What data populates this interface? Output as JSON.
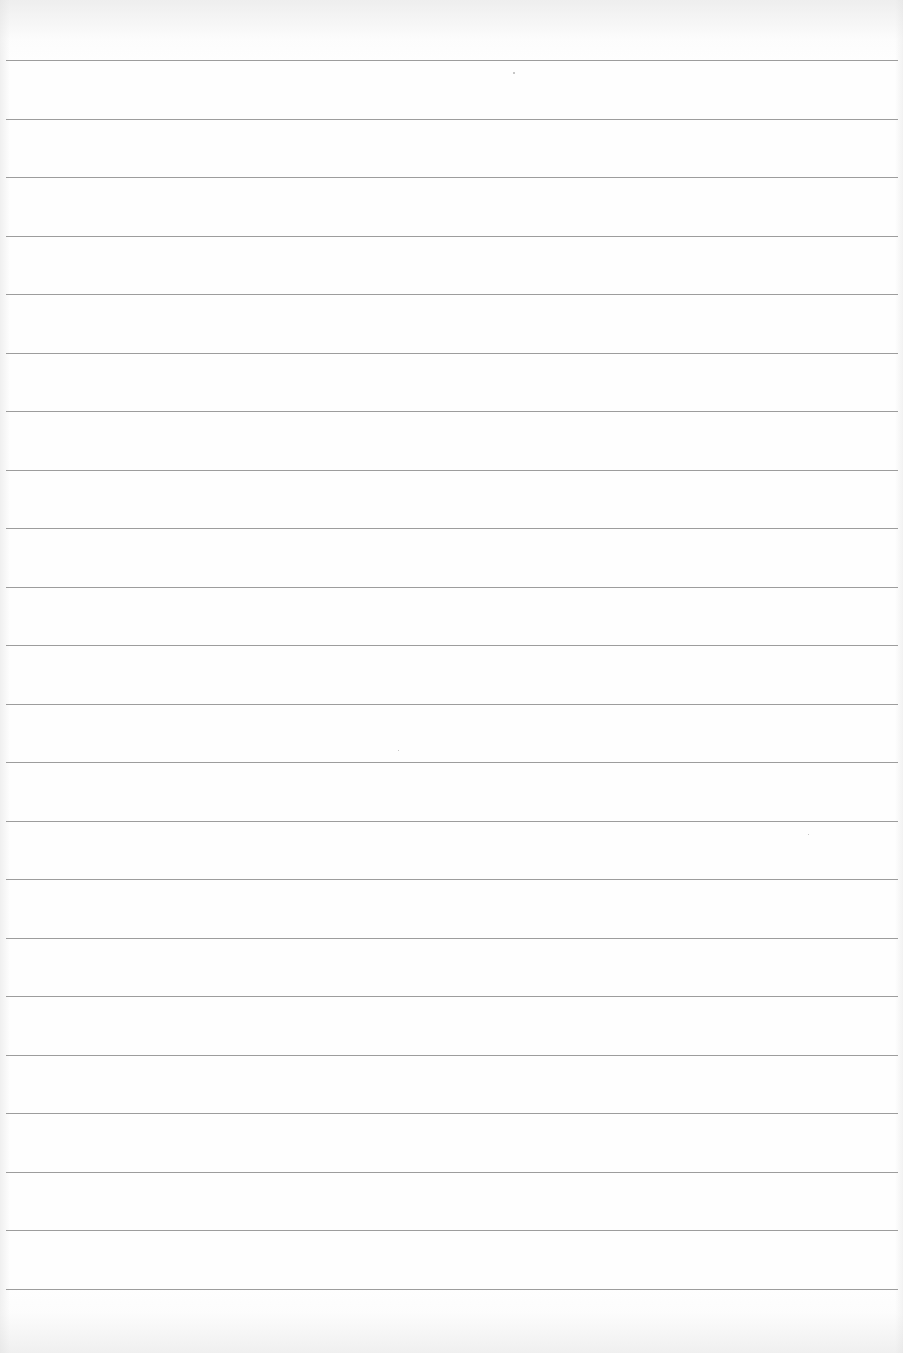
{
  "page": {
    "type": "blank lined paper",
    "background_color": "#fdfdfd",
    "rule_color": "#8c8c8c",
    "rule_count": 22,
    "rule_spacing_px": 58.5,
    "first_rule_y": 60,
    "rule_left_x": 6,
    "rule_right_x": 898,
    "text": ""
  }
}
